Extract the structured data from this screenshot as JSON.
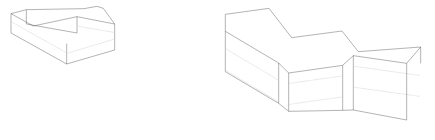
{
  "figure": {
    "background_color": "#ffffff",
    "line_color": "#1a1a1a",
    "hidden_line_color": "#3a3a3a",
    "width": 435,
    "height": 140,
    "objects": [
      {
        "name": "left-stepped-block",
        "description": "L-shaped / stepped rectangular block shown in isometric projection with a raised rib along its back-top edge and a notch near the right end of the rib",
        "visible_faces": [
          "top",
          "front",
          "right-end"
        ],
        "hidden_line_count": 3
      },
      {
        "name": "right-zigzag-block",
        "description": "Zigzag wall solid of constant thickness shown in isometric projection, formed of three panel segments joined at alternating inside and outside corners",
        "visible_faces": [
          "top",
          "front",
          "left-end",
          "right-end"
        ],
        "hidden_line_count": 6
      }
    ]
  },
  "left_block": {
    "label": "left-stepped-block",
    "top_face": "M 33,41 L 79,29 L 79,28 L 237,26 L 252,29 L 289,22 L 291,23 L 296,23 L 310,25 L 438,46 L 344,72 L 231,50 L 100,78 L 33,41 Z",
    "base_front": "M 33,41 L 33,99 L 200,192 L 200,131 Z",
    "base_right": "M 200,192 L 344,150 L 344,72 L 200,131 Z",
    "rib_front": "M 79,29 L 79,72 L 231,99 L 231,50 Z",
    "outline": "M 33,41 L 79,29 L 252,26 L 291,19 L 310,25 L 344,72 L 344,150 L 200,192 L 33,99 Z",
    "edges": [
      "M 33,41 L 79,29",
      "M 79,29 L 252,26",
      "M 252,26 L 291,19",
      "M 291,19 L 310,25",
      "M 310,25 L 344,72",
      "M 344,72 L 231,50",
      "M 231,50 L 100,78",
      "M 100,78 L 33,41",
      "M 33,41 L 33,99",
      "M 33,99 L 200,192",
      "M 200,192 L 344,150",
      "M 344,150 L 344,72",
      "M 79,29 L 79,72",
      "M 79,72 L 231,99",
      "M 231,99 L 231,50",
      "M 200,131 L 200,192"
    ],
    "hidden_edges": [
      "M 38,68 L 196,161",
      "M 204,160 L 341,119",
      "M 236,78 L 341,98"
    ]
  },
  "right_block": {
    "label": "right-zigzag-block",
    "outline": "M 676,94 L 676,43 L 807,25 L 875,113 L 1026,93 L 1075,155 L 1262,141 L 1262,190 L 1220,225 L 1220,359 L 1028,345 L 1028,331 L 866,348 L 866,334 L 834,330 L 834,310 L 676,94",
    "edges": [
      "M 676,43 L 807,25",
      "M 807,25 L 875,113",
      "M 875,113 L 1026,93",
      "M 1026,93 L 1075,155",
      "M 1075,155 L 1262,141",
      "M 1262,141 L 1262,190",
      "M 676,43 L 676,94",
      "M 836,112 L 836,310",
      "M 866,110 L 866,334",
      "M 1028,88 L 1028,331",
      "M 1060,92 L 1060,330",
      "M 1220,137 L 1220,360",
      "M 676,94 L 834,310",
      "M 834,310 L 866,334",
      "M 866,334 L 1028,331",
      "M 1028,331 L 1060,330",
      "M 1060,330 L 1220,360",
      "M 1220,360 L 1262,190"
    ],
    "hidden_edges": [
      "M 680,150 L 833,180",
      "M 680,215 L 833,245",
      "M 868,183 L 1026,155",
      "M 868,247 L 1026,218",
      "M 1064,158 L 1258,182",
      "M 1064,222 L 1258,246"
    ]
  }
}
